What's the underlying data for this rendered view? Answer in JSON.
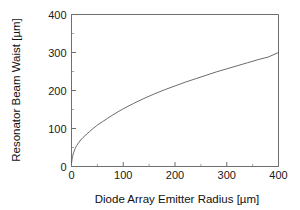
{
  "chart_data": {
    "type": "line",
    "title": "",
    "xlabel": "Diode Array Emitter  Radius [µm]",
    "ylabel": "Resonator Beam Waist [µm]",
    "xlim": [
      0,
      400
    ],
    "ylim": [
      0,
      400
    ],
    "xticks": [
      0,
      100,
      200,
      300,
      400
    ],
    "yticks": [
      0,
      100,
      200,
      300,
      400
    ],
    "xtick_labels": [
      "0",
      "100",
      "200",
      "300",
      "400"
    ],
    "ytick_labels": [
      "0",
      "100",
      "200",
      "300",
      "400"
    ],
    "xminor_ticks": [
      50,
      150,
      250,
      350
    ],
    "yminor_ticks": [
      50,
      150,
      250,
      350
    ],
    "grid": false,
    "legend": null,
    "series": [
      {
        "name": "Resonator beam waist vs emitter radius",
        "color": "#5a5a5a",
        "x": [
          0,
          1,
          2,
          4,
          6,
          8,
          10,
          14,
          18,
          22,
          26,
          30,
          35,
          40,
          50,
          60,
          70,
          80,
          90,
          100,
          120,
          140,
          160,
          180,
          200,
          220,
          240,
          260,
          280,
          300,
          320,
          340,
          360,
          380,
          400
        ],
        "y": [
          8,
          18,
          26,
          36,
          44,
          50,
          55,
          63,
          70,
          76,
          81,
          86,
          92,
          98,
          109,
          118,
          127,
          136,
          144,
          152,
          166,
          179,
          191,
          202,
          212,
          222,
          231,
          240,
          249,
          257,
          265,
          273,
          281,
          288,
          300
        ]
      }
    ]
  },
  "axis_titles": {
    "x": "Diode Array Emitter  Radius [µm]",
    "y": "Resonator Beam Waist [µm]"
  },
  "colors": {
    "curve": "#5a5a5a",
    "axis": "#6e6e6e",
    "text": "#111111",
    "background": "#ffffff"
  }
}
